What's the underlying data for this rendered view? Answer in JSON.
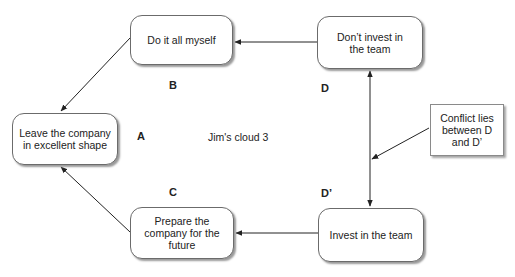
{
  "diagram": {
    "title": "Jim's cloud 3",
    "nodes": {
      "A": {
        "text": "Leave the company in excellent shape",
        "label": "A"
      },
      "B": {
        "text": "Do it all myself",
        "label": "B"
      },
      "C": {
        "text": "Prepare the company for the future",
        "label": "C"
      },
      "D": {
        "text": "Don’t invest in the team",
        "label": "D"
      },
      "Dprime": {
        "text": "Invest in the team",
        "label": "D’"
      }
    },
    "note": {
      "text": "Conflict lies between D and D’"
    },
    "edges": [
      {
        "from": "D",
        "to": "B"
      },
      {
        "from": "B",
        "to": "A"
      },
      {
        "from": "Dprime",
        "to": "C"
      },
      {
        "from": "C",
        "to": "A"
      },
      {
        "from": "D",
        "to": "Dprime",
        "bidirectional": true
      },
      {
        "from": "note",
        "to": "D-Dprime-edge"
      }
    ],
    "colors": {
      "line": "#222222",
      "border": "#6b6b6b",
      "shadow": "#9a9a9a"
    }
  }
}
